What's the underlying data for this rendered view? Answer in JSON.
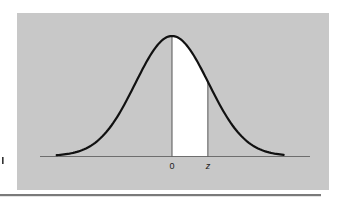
{
  "chart_data": {
    "type": "area",
    "title": "",
    "xlabel": "",
    "ylabel": "",
    "tick_labels": [
      "0",
      "z"
    ],
    "distribution": {
      "name": "standard normal",
      "mean": 0,
      "sd": 1
    },
    "x_range": [
      -3.15,
      3.05
    ],
    "shaded_region": {
      "from": 0,
      "to": "z",
      "z_approx": 0.98,
      "fill": "#ffffff"
    },
    "grid": false,
    "legend": null,
    "series": [
      {
        "name": "normal density",
        "x": [
          -3,
          -2,
          -1,
          0,
          1,
          2,
          3
        ],
        "values": [
          0.0044,
          0.054,
          0.242,
          0.399,
          0.242,
          0.054,
          0.0044
        ]
      }
    ]
  },
  "labels": {
    "zero": "0",
    "z": "z",
    "side_mark": "1"
  },
  "colors": {
    "panel": "#c8c8c8",
    "curve": "#111111",
    "axis": "#6e6e6e",
    "shade": "#ffffff",
    "rule": "#7a7a7a",
    "background": "#ffffff"
  }
}
